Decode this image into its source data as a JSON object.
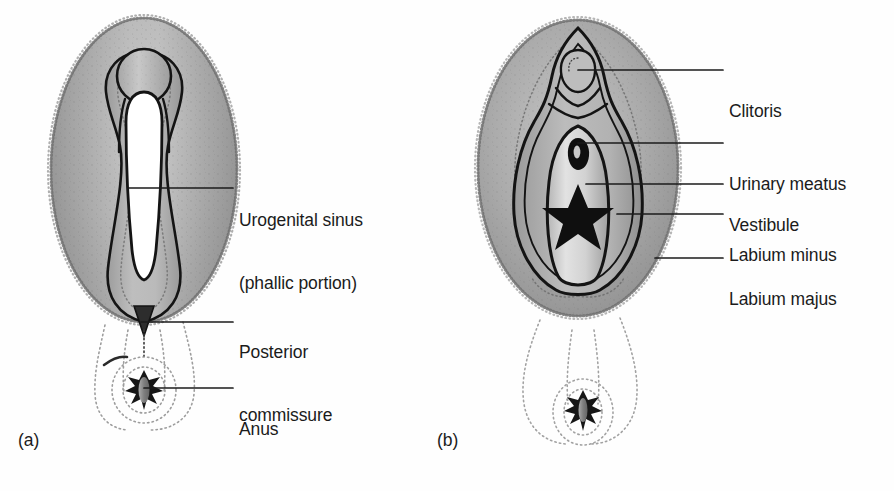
{
  "figure": {
    "type": "anatomical-diagram",
    "background_color": "#fefefe",
    "ink_color": "#1b1b1b",
    "tissue_gray": "#a9a9a9",
    "tissue_light": "#d9d9d9",
    "tissue_dark": "#8d8d8d"
  },
  "panels": [
    {
      "id": "a",
      "letter": "(a)",
      "letter_pos": {
        "x": 18,
        "y": 430
      },
      "callouts": [
        {
          "id": "urogenital-sinus",
          "label_line1": "Urogenital sinus",
          "label_line2": "(phallic portion)",
          "text_x": 239,
          "text_y": 177,
          "leader": {
            "x1": 128,
            "y1": 188,
            "x2": 233,
            "y2": 188
          }
        },
        {
          "id": "posterior-commissure",
          "label_line1": "Posterior",
          "label_line2": "commissure",
          "text_x": 239,
          "text_y": 301,
          "leader": {
            "x1": 141,
            "y1": 322,
            "x2": 233,
            "y2": 322
          }
        },
        {
          "id": "anus",
          "label_line1": "Anus",
          "label_line2": "",
          "text_x": 239,
          "text_y": 377,
          "leader": {
            "x1": 144,
            "y1": 388,
            "x2": 233,
            "y2": 388
          }
        }
      ]
    },
    {
      "id": "b",
      "letter": "(b)",
      "letter_pos": {
        "x": 437,
        "y": 430
      },
      "callouts": [
        {
          "id": "clitoris",
          "label_line1": "Clitoris",
          "label_line2": "",
          "text_x": 729,
          "text_y": 54,
          "leader": {
            "x1": 594,
            "y1": 70,
            "x2": 723,
            "y2": 70
          }
        },
        {
          "id": "urinary-meatus",
          "label_line1": "Urinary meatus",
          "label_line2": "",
          "text_x": 729,
          "text_y": 122,
          "leader": {
            "x1": 605,
            "y1": 143,
            "x2": 723,
            "y2": 143
          }
        },
        {
          "id": "vestibule",
          "label_line1": "Vestibule",
          "label_line2": "",
          "text_x": 729,
          "text_y": 164,
          "leader": {
            "x1": 603,
            "y1": 184,
            "x2": 723,
            "y2": 184
          }
        },
        {
          "id": "labium-minus",
          "label_line1": "Labium minus",
          "label_line2": "",
          "text_x": 729,
          "text_y": 202,
          "leader": {
            "x1": 617,
            "y1": 214,
            "x2": 723,
            "y2": 214
          }
        },
        {
          "id": "labium-majus",
          "label_line1": "Labium majus",
          "label_line2": "",
          "text_x": 729,
          "text_y": 244,
          "leader": {
            "x1": 655,
            "y1": 258,
            "x2": 723,
            "y2": 258
          }
        }
      ]
    }
  ],
  "structures": {
    "panel_a": [
      "genital-tubercle-phallus",
      "urogenital-sinus-slit",
      "labioscrotal-swelling-oval",
      "posterior-commissure-notch",
      "anus-star"
    ],
    "panel_b": [
      "clitoris",
      "urinary-meatus",
      "vestibule",
      "vaginal-orifice-star",
      "labium-minus",
      "labium-majus",
      "anus-star"
    ]
  }
}
